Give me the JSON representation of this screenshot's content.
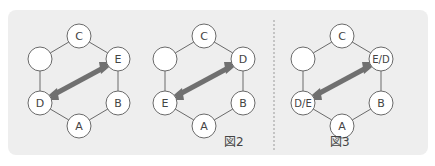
{
  "colors": {
    "panel_bg": "#eeeeee",
    "node_fill": "#ffffff",
    "node_stroke": "#6a6a6a",
    "ring_stroke": "#6a6a6a",
    "arrow": "#707070",
    "divider": "#9a9a9a",
    "text": "#444444"
  },
  "diagrams": [
    {
      "id": "diagram-1",
      "nodes": {
        "top": "C",
        "upper_left": "",
        "upper_right": "E",
        "lower_left": "D",
        "lower_right": "B",
        "bottom": "A"
      },
      "arrow": "double-headed, lower_left <-> upper_right"
    },
    {
      "id": "diagram-2",
      "nodes": {
        "top": "C",
        "upper_left": "",
        "upper_right": "D",
        "lower_left": "E",
        "lower_right": "B",
        "bottom": "A"
      },
      "arrow": "double-headed, lower_left <-> upper_right"
    },
    {
      "id": "diagram-3",
      "nodes": {
        "top": "C",
        "upper_left": "",
        "upper_right": "E/D",
        "lower_left": "D/E",
        "lower_right": "B",
        "bottom": "A"
      },
      "arrow": "double-headed, lower_left <-> upper_right"
    }
  ],
  "captions": {
    "fig2": "図2",
    "fig3": "図3"
  }
}
